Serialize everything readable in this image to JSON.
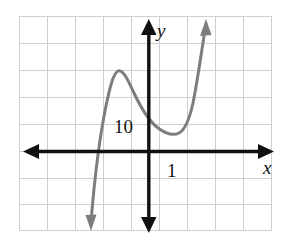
{
  "figure": {
    "kind": "coordinate-plane-graph",
    "background_color": "#ffffff",
    "grid": {
      "visible": true,
      "color": "#cfcfd3",
      "cell_size_px": 28,
      "columns": 9,
      "rows": 8,
      "left_px": 19,
      "top_px": 16,
      "right_px": 272,
      "bottom_px": 230
    },
    "axes": {
      "color": "#111111",
      "x_axis": {
        "label": "x",
        "y_px": 151,
        "from_px": 24,
        "to_px": 274,
        "arrow_both_ends": true
      },
      "y_axis": {
        "label": "y",
        "x_px": 149,
        "from_px": 20,
        "to_px": 232,
        "arrow_both_ends": true
      },
      "x_label_pos": {
        "x": 264,
        "y": 172
      },
      "y_label_pos": {
        "x": 157,
        "y": 36
      }
    },
    "tick_labels": [
      {
        "text": "10",
        "axis": "y",
        "x": 115,
        "y": 132
      },
      {
        "text": "1",
        "axis": "x",
        "x": 166,
        "y": 176
      }
    ],
    "curve": {
      "name": "cubic-curve",
      "color": "#7d7d80",
      "stroke_width": 3,
      "arrow_start": true,
      "arrow_end": true,
      "description": "cubic polynomial with local maximum and local minimum",
      "local_maximum_px": {
        "x": 117,
        "y": 71
      },
      "local_minimum_px": {
        "x": 178,
        "y": 133
      },
      "x_axis_crossing_px": {
        "x": 96,
        "y": 151
      },
      "start_arrow_px": {
        "x": 90,
        "y": 228
      },
      "end_arrow_px": {
        "x": 206,
        "y": 21
      },
      "path": "M 91 222 C 94 185 99 140 106 106 C 110 87 113 74 118 71 C 123 69 128 80 134 93 C 141 108 149 121 158 128 C 166 134 173 136 179 133 C 185 130 189 121 193 103 C 197 84 201 55 205 30"
    }
  }
}
